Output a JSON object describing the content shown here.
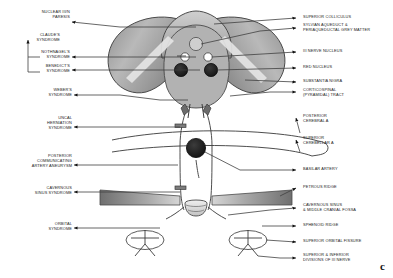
{
  "figure": {
    "corner_mark": "c",
    "colors": {
      "outline": "#3b3b3b",
      "leader_line": "#404040",
      "arrowhead": "#111111",
      "midbrain_light": "#d8d8d8",
      "midbrain_mid": "#a8a8a8",
      "midbrain_dark": "#6e6e6e",
      "nucleus_dark": "#1d1d1d",
      "nucleus_white": "#ffffff",
      "aqueduct_grey": "#cfcfcf",
      "ridge_grey": "#8d8d8d",
      "text": "#1a1a1a",
      "background": "#ffffff"
    }
  },
  "left_labels": [
    {
      "id": "nuclear-iii-n-paresis",
      "text": "NUCLEAR III/N\nPARESIS"
    },
    {
      "id": "claudes-syndrome",
      "text": "CLAUDE'S\nSYNDROME"
    },
    {
      "id": "nothnagels-syndrome",
      "text": "NOTHNAGEL'S\nSYNDROME"
    },
    {
      "id": "benedicts-syndrome",
      "text": "BENEDICT'S\nSYNDROME"
    },
    {
      "id": "webers-syndrome",
      "text": "WEBER'S\nSYNDROME"
    },
    {
      "id": "uncal-herniation-syndrome",
      "text": "UNCAL\nHERNIATION\nSYNDROME"
    },
    {
      "id": "posterior-communicating-artery-aneurysm",
      "text": "POSTERIOR\nCOMMUNICATING\nARTERY ANEURYSM"
    },
    {
      "id": "cavernous-sinus-syndrome",
      "text": "CAVERNOUS\nSINUS SYNDROME"
    },
    {
      "id": "orbital-syndrome",
      "text": "ORBITAL\nSYNDROME"
    }
  ],
  "right_labels": [
    {
      "id": "superior-colliculus",
      "text": "SUPERIOR COLLICULUS"
    },
    {
      "id": "sylvian-aqueduct-periaqueductal-grey-matter",
      "text": "SYLVIAN AQUEDUCT &\nPERIAQUEDUCTAL GREY MATTER"
    },
    {
      "id": "iii-nerve-nucleus",
      "text": "III NERVE NUCLEUS"
    },
    {
      "id": "red-nucleus",
      "text": "RED NUCLEUS"
    },
    {
      "id": "substantia-nigra",
      "text": "SUBSTANTIA NIGRA"
    },
    {
      "id": "corticospinal-pyramidal-tract",
      "text": "CORTICOSPINAL\n(PYRAMIDAL) TRACT"
    },
    {
      "id": "posterior-cerebral-a",
      "text": "POSTERIOR\nCEREBRAL A"
    },
    {
      "id": "superior-cerebellar-a",
      "text": "SUPERIOR\nCEREBELLAR A"
    },
    {
      "id": "basilar-artery",
      "text": "BASILAR ARTERY"
    },
    {
      "id": "petrous-ridge",
      "text": "PETROUS RIDGE"
    },
    {
      "id": "cavernous-sinus-middle-cranial-fossa",
      "text": "CAVERNOUS SINUS\n& MIDDLE CRANIAL FOSSA"
    },
    {
      "id": "sphenoid-ridge",
      "text": "SPHENOID RIDGE"
    },
    {
      "id": "superior-orbital-fissure",
      "text": "SUPERIOR ORBITAL FISSURE"
    },
    {
      "id": "superior-inferior-divisions-of-iii-nerve",
      "text": "SUPERIOR & INFERIOR\nDIVISIONS  OF III NERVE"
    }
  ]
}
